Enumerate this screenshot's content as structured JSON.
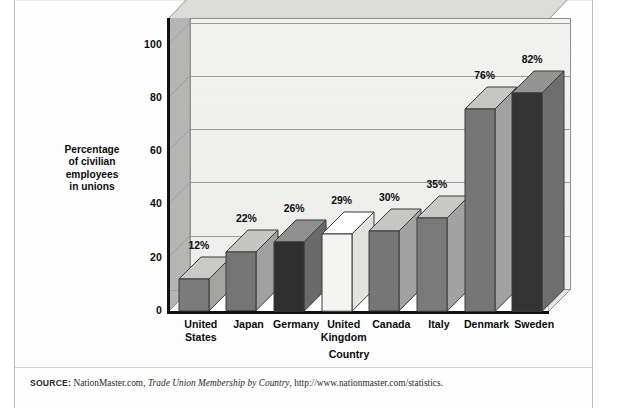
{
  "figure": {
    "source_label": "SOURCE:",
    "source_text_1": " NationMaster.com, ",
    "source_title": "Trade Union Membership by Country",
    "source_text_2": ", http://www.nationmaster.com/statistics."
  },
  "chart_data": {
    "type": "bar",
    "title": "",
    "subtitle": "",
    "xlabel": "Country",
    "ylabel": "Percentage of civilian employees in unions",
    "ylabel_lines": [
      "Percentage",
      "of civilian",
      "employees",
      "in unions"
    ],
    "categories": [
      "United States",
      "Japan",
      "Germany",
      "United Kingdom",
      "Canada",
      "Italy",
      "Denmark",
      "Sweden"
    ],
    "category_lines": [
      [
        "United",
        "States"
      ],
      [
        "Japan"
      ],
      [
        "Germany"
      ],
      [
        "United",
        "Kingdom"
      ],
      [
        "Canada"
      ],
      [
        "Italy"
      ],
      [
        "Denmark"
      ],
      [
        "Sweden"
      ]
    ],
    "values": [
      12,
      22,
      26,
      29,
      30,
      35,
      76,
      82
    ],
    "data_labels": [
      "12%",
      "22%",
      "26%",
      "29%",
      "30%",
      "35%",
      "76%",
      "82%"
    ],
    "bar_colors": [
      "#7b7b7b",
      "#757575",
      "#2f2f2f",
      "#f4f4f2",
      "#767676",
      "#7a7a7a",
      "#767676",
      "#333333"
    ],
    "bar_top_colors": [
      "#c9c9c7",
      "#c5c5c3",
      "#8f8f8f",
      "#fefefe",
      "#c6c6c4",
      "#c8c8c6",
      "#c6c6c4",
      "#949494"
    ],
    "bar_side_colors": [
      "#a3a3a1",
      "#a0a0a0",
      "#6a6a6a",
      "#e2e2e0",
      "#a1a1a1",
      "#a2a2a2",
      "#a1a1a1",
      "#6e6e6e"
    ],
    "ylim": [
      0,
      110
    ],
    "yticks": [
      0,
      20,
      40,
      60,
      80,
      100
    ],
    "ytick_labels": [
      "0",
      "20",
      "40",
      "60",
      "80",
      "100"
    ],
    "grid": true,
    "legend": "none",
    "unit": "%"
  },
  "style": {
    "plot_panel_color": "#f0f0ee",
    "wall_color": "#b5b5b3",
    "floor_color": "#a8a8a6",
    "axis_color": "#111111",
    "grid_color": "#9a9c9e"
  }
}
